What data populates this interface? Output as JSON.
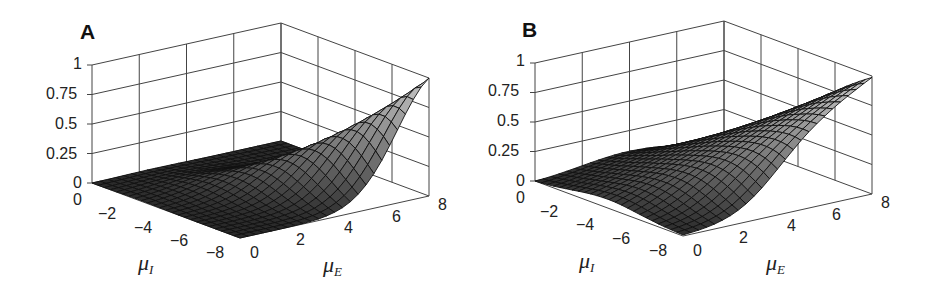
{
  "chart_data": [
    {
      "panel": "A",
      "type": "surface3d",
      "title": "A",
      "xlabel": "μ_E",
      "ylabel": "μ_I",
      "zlabel": "",
      "x_ticks": [
        "0",
        "2",
        "4",
        "6",
        "8"
      ],
      "y_ticks": [
        "0",
        "−2",
        "−4",
        "−6",
        "−8"
      ],
      "z_ticks": [
        "0",
        "0.25",
        "0.5",
        "0.75",
        "1"
      ],
      "xlim": [
        0,
        8
      ],
      "ylim": [
        -8,
        0
      ],
      "zlim": [
        0,
        1
      ],
      "grid": true,
      "description": "Bell-shaped surface peaking at ~1 near μE=8, μI=0 (back corner); falls to ~0 toward μE=0 and μI=-8; symmetric ridge along the diagonal μE ≈ -μI",
      "peak": {
        "mu_E": 8,
        "mu_I": 0,
        "z": 1.0
      },
      "shape": "gaussian_diagonal_narrow",
      "sample_values": [
        {
          "mu_E": 0,
          "mu_I": 0,
          "z": 0.02
        },
        {
          "mu_E": 4,
          "mu_I": -4,
          "z": 0.5
        },
        {
          "mu_E": 8,
          "mu_I": -8,
          "z": 0.0
        },
        {
          "mu_E": 8,
          "mu_I": 0,
          "z": 1.0
        },
        {
          "mu_E": 8,
          "mu_I": -4,
          "z": 0.2
        },
        {
          "mu_E": 4,
          "mu_I": 0,
          "z": 0.2
        }
      ]
    },
    {
      "panel": "B",
      "type": "surface3d",
      "title": "B",
      "xlabel": "μ_E",
      "ylabel": "μ_I",
      "zlabel": "",
      "x_ticks": [
        "0",
        "2",
        "4",
        "6",
        "8"
      ],
      "y_ticks": [
        "0",
        "−2",
        "−4",
        "−6",
        "−8"
      ],
      "z_ticks": [
        "0",
        "0.25",
        "0.5",
        "0.75",
        "1"
      ],
      "xlim": [
        0,
        8
      ],
      "ylim": [
        -8,
        0
      ],
      "zlim": [
        0,
        1
      ],
      "grid": true,
      "description": "Broader sigmoidal surface peaking at ~1 near μE=8, μI=0; decays more slowly, remaining ~0.15 at μE=8, μI=-8",
      "peak": {
        "mu_E": 8,
        "mu_I": 0,
        "z": 1.0
      },
      "shape": "broad_sigmoid_diagonal",
      "sample_values": [
        {
          "mu_E": 0,
          "mu_I": 0,
          "z": 0.03
        },
        {
          "mu_E": 4,
          "mu_I": -4,
          "z": 0.35
        },
        {
          "mu_E": 8,
          "mu_I": -8,
          "z": 0.15
        },
        {
          "mu_E": 8,
          "mu_I": 0,
          "z": 1.0
        },
        {
          "mu_E": 8,
          "mu_I": -4,
          "z": 0.45
        },
        {
          "mu_E": 4,
          "mu_I": 0,
          "z": 0.4
        }
      ]
    }
  ],
  "panels": {
    "a": {
      "letter": "A",
      "z_ticks": [
        "1",
        "0.75",
        "0.5",
        "0.25",
        "0"
      ],
      "mu_i_ticks": [
        "0",
        "−2",
        "−4",
        "−6",
        "−8"
      ],
      "mu_e_ticks": [
        "0",
        "2",
        "4",
        "6",
        "8"
      ],
      "mu_i_label": "μ",
      "mu_i_sub": "I",
      "mu_e_label": "μ",
      "mu_e_sub": "E"
    },
    "b": {
      "letter": "B",
      "z_ticks": [
        "1",
        "0.75",
        "0.5",
        "0.25",
        "0"
      ],
      "mu_i_ticks": [
        "0",
        "−2",
        "−4",
        "−6",
        "−8"
      ],
      "mu_e_ticks": [
        "0",
        "2",
        "4",
        "6",
        "8"
      ],
      "mu_i_label": "μ",
      "mu_i_sub": "I",
      "mu_e_label": "μ",
      "mu_e_sub": "E"
    }
  },
  "colors": {
    "surface_low": "#2a2a2a",
    "surface_high": "#c8c8c8",
    "mesh": "#111111",
    "axes": "#444444"
  }
}
